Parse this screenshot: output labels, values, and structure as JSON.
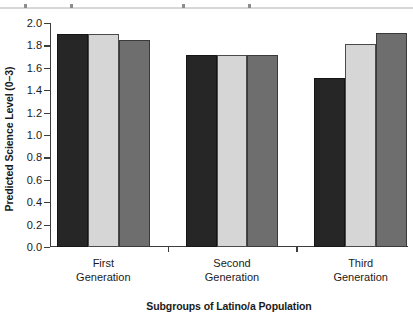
{
  "chart_data": {
    "type": "bar",
    "title": "",
    "xlabel": "Subgroups of Latino/a Population",
    "ylabel": "Predicted Science Level (0–3)",
    "categories": [
      "First\nGeneration",
      "Second\nGeneration",
      "Third\nGeneration"
    ],
    "category_lines": [
      [
        "First",
        "Generation"
      ],
      [
        "Second",
        "Generation"
      ],
      [
        "Third",
        "Generation"
      ]
    ],
    "series": [
      {
        "name": "series-1",
        "color": "#262626",
        "values": [
          1.9,
          1.71,
          1.51
        ]
      },
      {
        "name": "series-2",
        "color": "#d6d6d6",
        "values": [
          1.9,
          1.71,
          1.81
        ]
      },
      {
        "name": "series-3",
        "color": "#6e6e6e",
        "values": [
          1.85,
          1.71,
          1.91
        ]
      }
    ],
    "ylim": [
      0.0,
      2.0
    ],
    "ytick_values": [
      0.0,
      0.2,
      0.4,
      0.6,
      0.8,
      1.0,
      1.2,
      1.4,
      1.6,
      1.8,
      2.0
    ],
    "ytick_labels": [
      "0.0",
      "0.2",
      "0.4",
      "0.6",
      "0.8",
      "1.0",
      "1.2",
      "1.4",
      "1.6",
      "1.8",
      "2.0"
    ],
    "grid": false,
    "legend": "none"
  }
}
